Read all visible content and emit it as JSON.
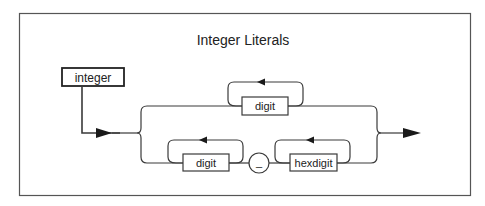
{
  "diagram": {
    "title": "Integer Literals",
    "entry_label": "integer",
    "alternatives": [
      {
        "name": "decimal",
        "nodes": [
          {
            "type": "nonterminal",
            "label": "digit",
            "repeat": true
          }
        ]
      },
      {
        "name": "based",
        "nodes": [
          {
            "type": "nonterminal",
            "label": "digit",
            "repeat": true
          },
          {
            "type": "terminal",
            "label": "_"
          },
          {
            "type": "nonterminal",
            "label": "hexdigit",
            "repeat": true
          }
        ]
      }
    ],
    "icons": {
      "flow_arrow": "filled-triangle-arrow"
    },
    "colors": {
      "line": "#3a3a3a",
      "background": "#ffffff"
    }
  }
}
